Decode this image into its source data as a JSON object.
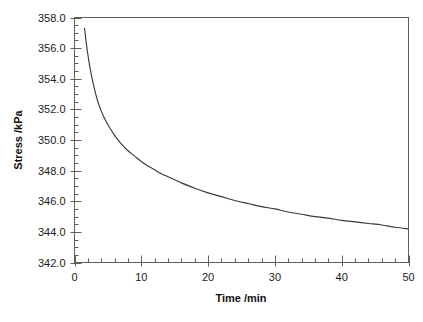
{
  "chart_data": {
    "type": "line",
    "title": "",
    "xlabel": "Time /min",
    "ylabel": "Stress /kPa",
    "xlim": [
      0,
      50
    ],
    "ylim": [
      342.0,
      358.0
    ],
    "grid": false,
    "legend": null,
    "x_major_ticks": [
      0,
      10,
      20,
      30,
      40,
      50
    ],
    "x_tick_labels": [
      "0",
      "10",
      "20",
      "30",
      "40",
      "50"
    ],
    "x_minor_tick_step": 2,
    "y_major_ticks": [
      342.0,
      344.0,
      346.0,
      348.0,
      350.0,
      352.0,
      354.0,
      356.0,
      358.0
    ],
    "y_tick_labels": [
      "342.0",
      "344.0",
      "346.0",
      "348.0",
      "350.0",
      "352.0",
      "354.0",
      "356.0",
      "358.0"
    ],
    "y_minor_tick_step": 0.5,
    "series": [
      {
        "name": "stress-relaxation",
        "color": "#3a3a3a",
        "x": [
          1.5,
          1.8,
          2.1,
          2.5,
          3.0,
          3.5,
          4.0,
          4.5,
          5.0,
          6.0,
          7.0,
          8.0,
          9.0,
          10.0,
          11.0,
          12.0,
          13.0,
          14.0,
          15.0,
          16.0,
          18.0,
          20.0,
          22.0,
          24.0,
          26.0,
          28.0,
          30.0,
          32.0,
          34.0,
          36.0,
          38.0,
          40.0,
          42.0,
          44.0,
          46.0,
          48.0,
          50.0
        ],
        "y": [
          357.3,
          356.2,
          355.3,
          354.3,
          353.3,
          352.5,
          351.9,
          351.4,
          351.0,
          350.3,
          349.75,
          349.3,
          348.95,
          348.6,
          348.3,
          348.05,
          347.8,
          347.6,
          347.4,
          347.2,
          346.85,
          346.55,
          346.3,
          346.05,
          345.85,
          345.65,
          345.5,
          345.3,
          345.15,
          345.0,
          344.9,
          344.75,
          344.65,
          344.55,
          344.45,
          344.3,
          344.2
        ]
      }
    ]
  },
  "axis": {
    "x_title": "Time /min",
    "y_title": "Stress /kPa"
  }
}
